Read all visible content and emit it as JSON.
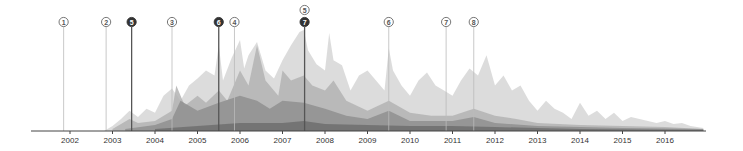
{
  "chart_data": {
    "type": "area",
    "title": "",
    "xlabel": "",
    "ylabel": "",
    "grid": false,
    "legend": "none",
    "x_axis": {
      "ticks": [
        "2002",
        "2003",
        "2004",
        "2005",
        "2006",
        "2007",
        "2008",
        "2009",
        "2010",
        "2011",
        "2012",
        "2013",
        "2014",
        "2015",
        "2016"
      ],
      "range": [
        2001.1,
        2016.95
      ]
    },
    "y_range": [
      0,
      1
    ],
    "series_colors": [
      "#d6d6d6",
      "#b3b3b3",
      "#8f8f8f",
      "#6e6e6e",
      "#4f4f4f"
    ],
    "series": [
      {
        "name": "layer-1 (lightest)",
        "x": [
          2002.8,
          2003.0,
          2003.2,
          2003.4,
          2003.6,
          2003.8,
          2004.0,
          2004.2,
          2004.4,
          2004.6,
          2004.8,
          2005.0,
          2005.2,
          2005.4,
          2005.5,
          2005.6,
          2005.8,
          2006.0,
          2006.1,
          2006.2,
          2006.4,
          2006.6,
          2006.8,
          2007.0,
          2007.2,
          2007.4,
          2007.5,
          2007.6,
          2007.8,
          2008.0,
          2008.1,
          2008.2,
          2008.4,
          2008.6,
          2008.8,
          2009.0,
          2009.2,
          2009.4,
          2009.5,
          2009.6,
          2009.8,
          2010.0,
          2010.2,
          2010.4,
          2010.6,
          2010.8,
          2011.0,
          2011.2,
          2011.4,
          2011.6,
          2011.8,
          2012.0,
          2012.2,
          2012.4,
          2012.6,
          2012.8,
          2013.0,
          2013.2,
          2013.4,
          2013.6,
          2013.8,
          2014.0,
          2014.2,
          2014.4,
          2014.6,
          2014.8,
          2015.0,
          2015.2,
          2015.4,
          2015.6,
          2015.8,
          2016.0,
          2016.2,
          2016.4,
          2016.6,
          2016.9
        ],
        "values": [
          0.0,
          0.05,
          0.12,
          0.2,
          0.14,
          0.22,
          0.18,
          0.35,
          0.42,
          0.3,
          0.45,
          0.52,
          0.6,
          0.55,
          0.85,
          0.5,
          0.72,
          0.9,
          0.62,
          0.75,
          0.88,
          0.6,
          0.52,
          0.7,
          0.85,
          0.98,
          1.0,
          0.8,
          0.66,
          0.6,
          0.97,
          0.7,
          0.65,
          0.4,
          0.55,
          0.6,
          0.5,
          0.4,
          0.82,
          0.6,
          0.45,
          0.35,
          0.5,
          0.58,
          0.45,
          0.4,
          0.35,
          0.5,
          0.62,
          0.55,
          0.75,
          0.45,
          0.55,
          0.4,
          0.45,
          0.3,
          0.2,
          0.3,
          0.22,
          0.18,
          0.12,
          0.28,
          0.15,
          0.2,
          0.12,
          0.18,
          0.1,
          0.14,
          0.12,
          0.1,
          0.08,
          0.1,
          0.07,
          0.08,
          0.05,
          0.03
        ]
      },
      {
        "name": "layer-2",
        "x": [
          2003.0,
          2003.4,
          2003.6,
          2004.0,
          2004.4,
          2004.5,
          2004.7,
          2005.0,
          2005.2,
          2005.5,
          2005.7,
          2006.0,
          2006.2,
          2006.4,
          2006.6,
          2006.9,
          2007.0,
          2007.2,
          2007.5,
          2007.7,
          2008.0,
          2008.2,
          2008.5,
          2009.0,
          2009.5,
          2010.0,
          2010.5,
          2011.0,
          2011.5,
          2012.0,
          2012.5,
          2013.0,
          2014.0,
          2015.0,
          2016.0,
          2016.9
        ],
        "values": [
          0.02,
          0.12,
          0.08,
          0.1,
          0.2,
          0.45,
          0.25,
          0.35,
          0.28,
          0.4,
          0.3,
          0.6,
          0.45,
          0.85,
          0.5,
          0.35,
          0.6,
          0.5,
          0.55,
          0.45,
          0.4,
          0.5,
          0.3,
          0.2,
          0.3,
          0.18,
          0.15,
          0.15,
          0.22,
          0.15,
          0.12,
          0.08,
          0.06,
          0.05,
          0.04,
          0.02
        ]
      },
      {
        "name": "layer-3",
        "x": [
          2003.3,
          2004.0,
          2004.4,
          2004.6,
          2005.0,
          2005.5,
          2006.0,
          2006.4,
          2006.7,
          2007.0,
          2007.5,
          2008.0,
          2008.5,
          2009.0,
          2009.5,
          2010.0,
          2011.0,
          2011.5,
          2012.0,
          2013.0,
          2014.0,
          2015.0,
          2016.9
        ],
        "values": [
          0.02,
          0.06,
          0.12,
          0.3,
          0.2,
          0.28,
          0.35,
          0.3,
          0.22,
          0.3,
          0.28,
          0.22,
          0.15,
          0.12,
          0.2,
          0.1,
          0.1,
          0.14,
          0.08,
          0.05,
          0.04,
          0.03,
          0.02
        ]
      },
      {
        "name": "layer-4",
        "x": [
          2004.0,
          2005.0,
          2006.0,
          2007.0,
          2007.5,
          2008.0,
          2009.0,
          2010.0,
          2011.0,
          2012.0,
          2013.0,
          2014.0,
          2016.9
        ],
        "values": [
          0.02,
          0.05,
          0.08,
          0.08,
          0.1,
          0.07,
          0.06,
          0.05,
          0.05,
          0.04,
          0.03,
          0.02,
          0.01
        ]
      }
    ],
    "annotations": [
      {
        "label": "1",
        "x": 2001.85,
        "style": "outline"
      },
      {
        "label": "2",
        "x": 2002.85,
        "style": "outline"
      },
      {
        "label": "5",
        "x": 2003.45,
        "style": "filled"
      },
      {
        "label": "3",
        "x": 2004.4,
        "style": "outline"
      },
      {
        "label": "6",
        "x": 2005.5,
        "style": "filled"
      },
      {
        "label": "4",
        "x": 2005.87,
        "style": "outline"
      },
      {
        "label": "5",
        "x": 2007.52,
        "style": "outline",
        "row": "upper"
      },
      {
        "label": "7",
        "x": 2007.52,
        "style": "filled"
      },
      {
        "label": "6",
        "x": 2009.5,
        "style": "outline"
      },
      {
        "label": "7",
        "x": 2010.85,
        "style": "outline"
      },
      {
        "label": "8",
        "x": 2011.5,
        "style": "outline"
      }
    ]
  },
  "axis": {
    "tick_labels": [
      "2002",
      "2003",
      "2004",
      "2005",
      "2006",
      "2007",
      "2008",
      "2009",
      "2010",
      "2011",
      "2012",
      "2013",
      "2014",
      "2015",
      "2016"
    ]
  },
  "markers": [
    {
      "label": "1",
      "filled": false
    },
    {
      "label": "2",
      "filled": false
    },
    {
      "label": "5",
      "filled": true
    },
    {
      "label": "3",
      "filled": false
    },
    {
      "label": "6",
      "filled": true
    },
    {
      "label": "4",
      "filled": false
    },
    {
      "label": "5",
      "filled": false
    },
    {
      "label": "7",
      "filled": true
    },
    {
      "label": "6",
      "filled": false
    },
    {
      "label": "7",
      "filled": false
    },
    {
      "label": "8",
      "filled": false
    }
  ]
}
